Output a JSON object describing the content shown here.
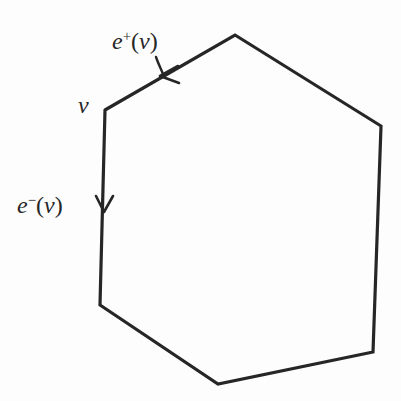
{
  "figure": {
    "background_color": "#fdfdfd",
    "stroke_color": "#262626",
    "stroke_width": 3.2
  },
  "labels": {
    "edge_out": {
      "base": "e",
      "sign": "+",
      "argument": "(v)",
      "full": "e+(v)"
    },
    "edge_in": {
      "base": "e",
      "sign": "−",
      "argument": "(v)",
      "full": "e−(v)"
    },
    "vertex": {
      "full": "v"
    }
  },
  "chart_data": {
    "type": "diagram",
    "title": "",
    "shape": "hexagon",
    "vertices": [
      {
        "name": "top",
        "x": 235,
        "y": 35
      },
      {
        "name": "upper-right",
        "x": 381,
        "y": 126
      },
      {
        "name": "lower-right",
        "x": 373,
        "y": 352
      },
      {
        "name": "bottom",
        "x": 218,
        "y": 384
      },
      {
        "name": "lower-left",
        "x": 100,
        "y": 305
      },
      {
        "name": "v",
        "x": 105,
        "y": 110
      }
    ],
    "edges": [
      {
        "from": "v",
        "to": "top",
        "label": "e+(v)",
        "oriented": true,
        "direction": "toward-v"
      },
      {
        "from": "top",
        "to": "upper-right",
        "label": "",
        "oriented": false
      },
      {
        "from": "upper-right",
        "to": "lower-right",
        "label": "",
        "oriented": false
      },
      {
        "from": "lower-right",
        "to": "bottom",
        "label": "",
        "oriented": false
      },
      {
        "from": "bottom",
        "to": "lower-left",
        "label": "",
        "oriented": false
      },
      {
        "from": "lower-left",
        "to": "v",
        "label": "e−(v)",
        "oriented": true,
        "direction": "away-from-v"
      }
    ],
    "arrows": [
      {
        "name": "arrow-e-plus",
        "x": 166,
        "y": 73,
        "angle_deg": 212,
        "points": "down-left"
      },
      {
        "name": "arrow-e-minus",
        "x": 104,
        "y": 206,
        "angle_deg": 90,
        "points": "down"
      }
    ]
  }
}
